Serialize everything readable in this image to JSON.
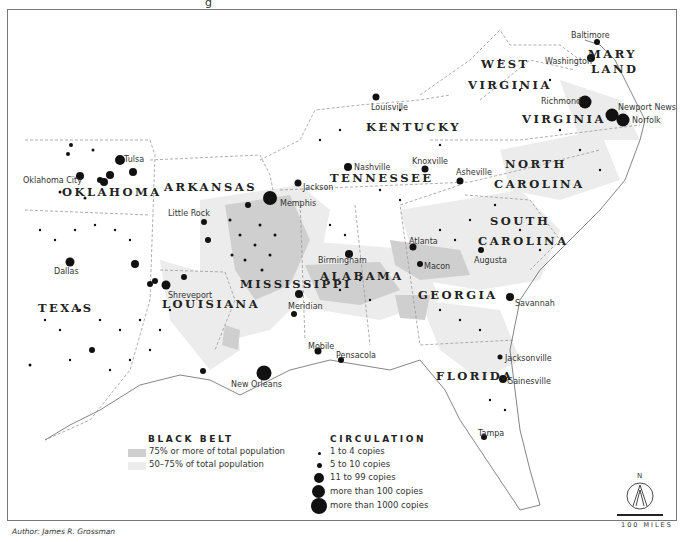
{
  "header": {
    "title_fragment": "g"
  },
  "states": [
    {
      "name": "OKLAHOMA",
      "x": 62,
      "y": 186
    },
    {
      "name": "ARKANSAS",
      "x": 164,
      "y": 181
    },
    {
      "name": "TEXAS",
      "x": 38,
      "y": 302
    },
    {
      "name": "LOUISIANA",
      "x": 162,
      "y": 298
    },
    {
      "name": "MISSISSIPPI",
      "x": 240,
      "y": 278
    },
    {
      "name": "ALABAMA",
      "x": 320,
      "y": 270
    },
    {
      "name": "TENNESSEE",
      "x": 330,
      "y": 172
    },
    {
      "name": "KENTUCKY",
      "x": 366,
      "y": 121
    },
    {
      "name": "WEST",
      "x": 481,
      "y": 58
    },
    {
      "name": "VIRGINIA",
      "x": 468,
      "y": 79
    },
    {
      "name": "VIRGINIA",
      "x": 522,
      "y": 113
    },
    {
      "name": "MARY",
      "x": 588,
      "y": 48
    },
    {
      "name": "LAND",
      "x": 591,
      "y": 63
    },
    {
      "name": "NORTH",
      "x": 505,
      "y": 158
    },
    {
      "name": "CAROLINA",
      "x": 494,
      "y": 178
    },
    {
      "name": "SOUTH",
      "x": 490,
      "y": 215
    },
    {
      "name": "CAROLINA",
      "x": 478,
      "y": 235
    },
    {
      "name": "GEORGIA",
      "x": 418,
      "y": 289
    },
    {
      "name": "FLORIDA",
      "x": 436,
      "y": 370
    }
  ],
  "cities": [
    {
      "name": "Tulsa",
      "x": 124,
      "y": 155
    },
    {
      "name": "Oklahoma City",
      "x": 23,
      "y": 176
    },
    {
      "name": "Dallas",
      "x": 54,
      "y": 267
    },
    {
      "name": "Little Rock",
      "x": 168,
      "y": 209
    },
    {
      "name": "Shreveport",
      "x": 168,
      "y": 291
    },
    {
      "name": "Memphis",
      "x": 280,
      "y": 199
    },
    {
      "name": "Jackson",
      "x": 303,
      "y": 183
    },
    {
      "name": "Nashville",
      "x": 354,
      "y": 163
    },
    {
      "name": "Louisville",
      "x": 371,
      "y": 103
    },
    {
      "name": "Knoxville",
      "x": 412,
      "y": 157
    },
    {
      "name": "Asheville",
      "x": 456,
      "y": 168
    },
    {
      "name": "Birmingham",
      "x": 318,
      "y": 256
    },
    {
      "name": "Meridian",
      "x": 288,
      "y": 302
    },
    {
      "name": "Atlanta",
      "x": 409,
      "y": 237
    },
    {
      "name": "Macon",
      "x": 424,
      "y": 262
    },
    {
      "name": "Augusta",
      "x": 474,
      "y": 256
    },
    {
      "name": "Savannah",
      "x": 515,
      "y": 299
    },
    {
      "name": "Mobile",
      "x": 308,
      "y": 342
    },
    {
      "name": "Pensacola",
      "x": 336,
      "y": 351
    },
    {
      "name": "New Orleans",
      "x": 231,
      "y": 380
    },
    {
      "name": "Jacksonville",
      "x": 505,
      "y": 354
    },
    {
      "name": "Gainesville",
      "x": 507,
      "y": 377
    },
    {
      "name": "Tampa",
      "x": 478,
      "y": 429
    },
    {
      "name": "Baltimore",
      "x": 571,
      "y": 31
    },
    {
      "name": "Washington",
      "x": 545,
      "y": 57
    },
    {
      "name": "Richmond",
      "x": 541,
      "y": 97
    },
    {
      "name": "Newport News",
      "x": 618,
      "y": 103
    },
    {
      "name": "Norfolk",
      "x": 632,
      "y": 116
    }
  ],
  "legend": {
    "black_belt": {
      "title": "BLACK BELT",
      "items": [
        {
          "label": "75% or more of total population",
          "color": "#cfcfcf"
        },
        {
          "label": "50–75% of total population",
          "color": "#ececec"
        }
      ]
    },
    "circulation": {
      "title": "CIRCULATION",
      "items": [
        {
          "label": "1 to 4 copies",
          "size": 3
        },
        {
          "label": "5 to 10 copies",
          "size": 5
        },
        {
          "label": "11 to 99 copies",
          "size": 10
        },
        {
          "label": "more than 100 copies",
          "size": 13
        },
        {
          "label": "more than 1000 copies",
          "size": 16
        }
      ]
    }
  },
  "compass": {
    "label": "N"
  },
  "scale": {
    "label": "100 MILES"
  },
  "credit": {
    "author": "Author: James R. Grossman"
  }
}
